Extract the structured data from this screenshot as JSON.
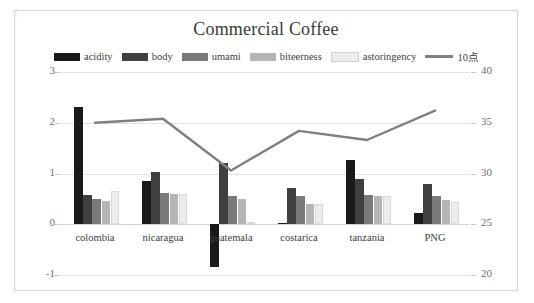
{
  "chart_data": {
    "type": "bar",
    "title": "Commercial Coffee",
    "xlabel": "",
    "ylabel": "",
    "categories": [
      "colombia",
      "nicaragua",
      "guatemala",
      "costarica",
      "tanzania",
      "PNG"
    ],
    "series": [
      {
        "name": "acidity",
        "type": "bar",
        "color": "#1a1a1a",
        "axis": "left",
        "values": [
          2.32,
          0.85,
          -0.85,
          0.03,
          1.27,
          0.22
        ]
      },
      {
        "name": "body",
        "type": "bar",
        "color": "#3f3f3f",
        "axis": "left",
        "values": [
          0.58,
          1.02,
          1.2,
          0.72,
          0.9,
          0.8
        ]
      },
      {
        "name": "umami",
        "type": "bar",
        "color": "#7a7a7a",
        "axis": "left",
        "values": [
          0.5,
          0.62,
          0.55,
          0.55,
          0.58,
          0.55
        ]
      },
      {
        "name": "biteerness",
        "type": "bar",
        "color": "#b5b5b5",
        "axis": "left",
        "values": [
          0.45,
          0.6,
          0.5,
          0.4,
          0.55,
          0.48
        ]
      },
      {
        "name": "astoringency",
        "type": "bar",
        "color": "#ededed",
        "axis": "left",
        "values": [
          0.65,
          0.6,
          0.05,
          0.4,
          0.55,
          0.43
        ]
      },
      {
        "name": "10点",
        "type": "line",
        "color": "#808080",
        "axis": "right",
        "values": [
          35.0,
          35.4,
          30.3,
          34.2,
          33.3,
          36.2
        ]
      }
    ],
    "y_left": {
      "ticks": [
        "3",
        "2",
        "1",
        "0",
        "-1"
      ],
      "min": -1,
      "max": 3
    },
    "y_right": {
      "ticks": [
        "40",
        "35",
        "30",
        "25",
        "20"
      ],
      "min": 20,
      "max": 40
    },
    "grid": true,
    "legend_position": "top"
  },
  "legend": {
    "items": [
      {
        "label": "acidity",
        "swatch": "#1a1a1a",
        "kind": "swatch"
      },
      {
        "label": "body",
        "swatch": "#3f3f3f",
        "kind": "swatch"
      },
      {
        "label": "umami",
        "swatch": "#7a7a7a",
        "kind": "swatch"
      },
      {
        "label": "biteerness",
        "swatch": "#b5b5b5",
        "kind": "swatch"
      },
      {
        "label": "astoringency",
        "swatch": "#ededed",
        "kind": "swatch"
      },
      {
        "label": "10点",
        "swatch": "#808080",
        "kind": "line"
      }
    ]
  }
}
